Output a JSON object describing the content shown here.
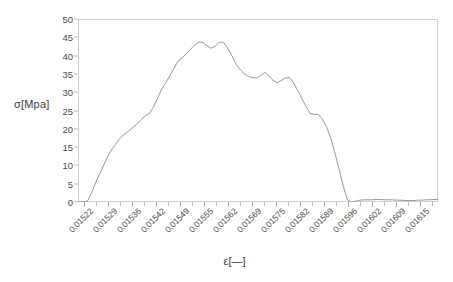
{
  "chart_data": {
    "type": "line",
    "title": "",
    "subtitle": "",
    "xlabel": "ε[—]",
    "ylabel": "σ[Mpa]",
    "ylim": [
      0,
      50
    ],
    "yticks": [
      0,
      5,
      10,
      15,
      20,
      25,
      30,
      35,
      40,
      45,
      50
    ],
    "ytick_labels": [
      "0",
      "5",
      "10",
      "15",
      "20",
      "25",
      "30",
      "35",
      "40",
      "45",
      "50"
    ],
    "xtick_labels": [
      "0,01522",
      "0,01529",
      "0,01536",
      "0,01542",
      "0,01549",
      "0,01555",
      "0,01562",
      "0,01569",
      "0,01575",
      "0,01582",
      "0,01589",
      "0,01596",
      "0,01602",
      "0,01609",
      "0,01615"
    ],
    "xtick_count": 30,
    "grid": false,
    "legend": "none",
    "line_color": "#8a8a8a",
    "frame_color": "#cfcfcf",
    "series": [
      {
        "name": "stress-strain",
        "x": [
          0.01519,
          0.01521,
          0.015225,
          0.01524,
          0.015255,
          0.01527,
          0.015285,
          0.0153,
          0.015315,
          0.01533,
          0.015345,
          0.01536,
          0.015375,
          0.01539,
          0.015405,
          0.01542,
          0.015435,
          0.01545,
          0.015465,
          0.01548,
          0.015495,
          0.01551,
          0.015525,
          0.01554,
          0.015555,
          0.01557,
          0.015585,
          0.0156,
          0.015615,
          0.01563,
          0.015645,
          0.01566,
          0.015675,
          0.01569,
          0.015705,
          0.01572,
          0.015735,
          0.01575,
          0.015765,
          0.01578,
          0.015795,
          0.01581,
          0.015825,
          0.01584,
          0.015855,
          0.01587,
          0.015885,
          0.0159,
          0.015915,
          0.01593,
          0.015945,
          0.01596,
          0.015975,
          0.01599,
          0.016005,
          0.01602,
          0.016035,
          0.01605,
          0.016065,
          0.01608,
          0.016095,
          0.01611,
          0.016125,
          0.01614,
          0.016155,
          0.01617,
          0.016185,
          0.0162
        ],
        "y": [
          0.0,
          0.0,
          0.3,
          2.6,
          5.4,
          7.9,
          10.3,
          12.7,
          14.6,
          16.1,
          17.6,
          18.6,
          19.4,
          20.4,
          21.4,
          22.5,
          23.6,
          24.2,
          26.0,
          28.4,
          30.9,
          32.6,
          34.6,
          36.6,
          38.6,
          39.4,
          40.6,
          41.8,
          42.9,
          43.7,
          43.6,
          42.6,
          42.0,
          42.6,
          43.7,
          43.6,
          42.0,
          40.0,
          37.6,
          36.2,
          35.0,
          34.3,
          34.0,
          33.9,
          34.6,
          35.4,
          34.4,
          33.2,
          32.6,
          33.2,
          33.9,
          34.0,
          32.5,
          30.4,
          28.2,
          26.0,
          24.2,
          24.0,
          23.9,
          22.6,
          20.4,
          17.4,
          13.4,
          9.0,
          4.4,
          0.6,
          0.0,
          0.0
        ]
      },
      {
        "name": "post-fracture-tail",
        "x": [
          0.016185,
          0.0162,
          0.016215,
          0.01623,
          0.016245,
          0.01626,
          0.016275,
          0.01629,
          0.016305,
          0.01632,
          0.016335,
          0.01635,
          0.016365,
          0.01638,
          0.016395,
          0.01641,
          0.016425,
          0.01644,
          0.016455,
          0.01647,
          0.016485,
          0.0165
        ],
        "y": [
          -0.3,
          0.2,
          0.5,
          0.6,
          0.6,
          0.6,
          0.7,
          0.7,
          0.6,
          0.6,
          0.6,
          0.5,
          0.5,
          0.4,
          0.4,
          0.4,
          0.5,
          0.5,
          0.6,
          0.6,
          0.7,
          0.7
        ]
      }
    ]
  },
  "axes": {
    "y_title": "σ[Mpa]",
    "x_title": "ε[—]"
  }
}
